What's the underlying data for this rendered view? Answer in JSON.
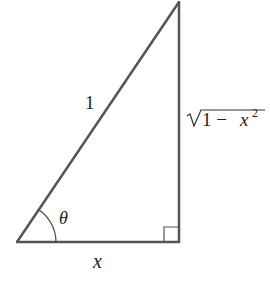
{
  "diagram": {
    "type": "right-triangle",
    "labels": {
      "hypotenuse": "1",
      "adjacent": "x",
      "opposite_prefix": "1 − ",
      "opposite_var": "x",
      "opposite_exp": "2",
      "angle": "θ"
    },
    "colors": {
      "stroke": "#555555",
      "text": "#222222",
      "background": "#ffffff"
    }
  }
}
